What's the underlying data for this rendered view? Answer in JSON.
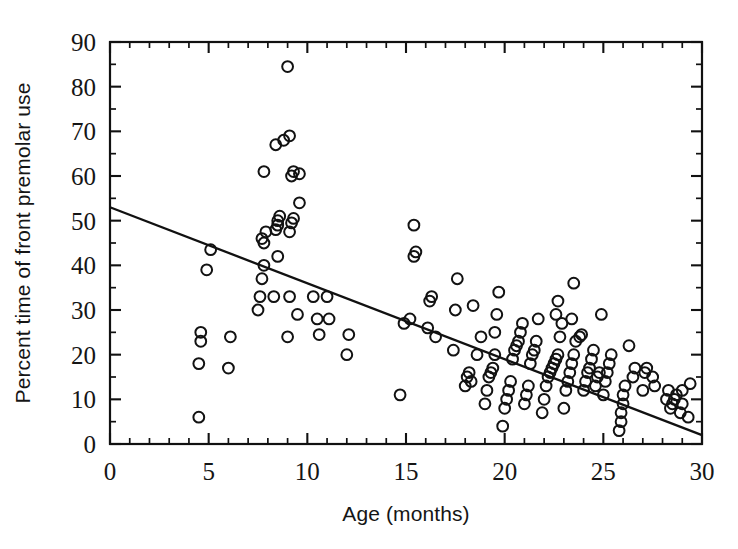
{
  "chart_data": {
    "type": "scatter",
    "title": "",
    "xlabel": "Age (months)",
    "ylabel": "Percent time of front premolar use",
    "xlim": [
      0,
      30
    ],
    "ylim": [
      0,
      90
    ],
    "xticks": [
      0,
      5,
      10,
      15,
      20,
      25,
      30
    ],
    "yticks": [
      0,
      10,
      20,
      30,
      40,
      50,
      60,
      70,
      80,
      90
    ],
    "x_minor_step": 1,
    "y_minor_step": 5,
    "grid": false,
    "legend": null,
    "marker": "open-circle",
    "marker_color": "#121212",
    "series": [
      {
        "name": "Front premolar use",
        "points": [
          [
            4.5,
            6
          ],
          [
            4.5,
            18
          ],
          [
            4.6,
            23
          ],
          [
            4.6,
            25
          ],
          [
            4.9,
            39
          ],
          [
            5.1,
            43.5
          ],
          [
            6.0,
            17
          ],
          [
            6.1,
            24
          ],
          [
            7.5,
            30
          ],
          [
            7.6,
            33
          ],
          [
            7.7,
            37
          ],
          [
            7.8,
            40
          ],
          [
            7.8,
            45
          ],
          [
            7.7,
            46
          ],
          [
            7.9,
            47.5
          ],
          [
            7.8,
            61
          ],
          [
            8.3,
            33
          ],
          [
            8.5,
            42
          ],
          [
            8.4,
            48
          ],
          [
            8.5,
            49
          ],
          [
            8.5,
            50
          ],
          [
            8.6,
            51
          ],
          [
            8.4,
            67
          ],
          [
            8.8,
            68
          ],
          [
            9.0,
            24
          ],
          [
            9.1,
            33
          ],
          [
            9.1,
            47.5
          ],
          [
            9.2,
            49.5
          ],
          [
            9.3,
            50.5
          ],
          [
            9.2,
            60
          ],
          [
            9.3,
            61
          ],
          [
            9.1,
            69
          ],
          [
            9.0,
            84.5
          ],
          [
            9.5,
            29
          ],
          [
            9.6,
            54
          ],
          [
            9.6,
            60.5
          ],
          [
            10.3,
            33
          ],
          [
            10.5,
            28
          ],
          [
            10.6,
            24.5
          ],
          [
            11.0,
            33
          ],
          [
            11.1,
            28
          ],
          [
            12.0,
            20
          ],
          [
            12.1,
            24.5
          ],
          [
            14.7,
            11
          ],
          [
            14.9,
            27
          ],
          [
            15.2,
            28
          ],
          [
            15.4,
            42
          ],
          [
            15.5,
            43
          ],
          [
            15.4,
            49
          ],
          [
            16.1,
            26
          ],
          [
            16.2,
            32
          ],
          [
            16.3,
            33
          ],
          [
            16.5,
            24
          ],
          [
            17.4,
            21
          ],
          [
            17.5,
            30
          ],
          [
            17.6,
            37
          ],
          [
            18.0,
            13
          ],
          [
            18.1,
            15
          ],
          [
            18.2,
            16
          ],
          [
            18.3,
            14
          ],
          [
            18.4,
            31
          ],
          [
            18.6,
            20
          ],
          [
            18.8,
            24
          ],
          [
            19.0,
            9
          ],
          [
            19.1,
            12
          ],
          [
            19.2,
            15
          ],
          [
            19.3,
            16
          ],
          [
            19.4,
            17
          ],
          [
            19.5,
            20
          ],
          [
            19.5,
            25
          ],
          [
            19.6,
            29
          ],
          [
            19.7,
            34
          ],
          [
            19.9,
            4
          ],
          [
            20.0,
            8
          ],
          [
            20.1,
            10
          ],
          [
            20.2,
            12
          ],
          [
            20.3,
            14
          ],
          [
            20.4,
            19
          ],
          [
            20.5,
            21
          ],
          [
            20.6,
            22
          ],
          [
            20.7,
            23
          ],
          [
            20.8,
            25
          ],
          [
            20.9,
            27
          ],
          [
            21.0,
            9
          ],
          [
            21.1,
            11
          ],
          [
            21.2,
            13
          ],
          [
            21.3,
            18
          ],
          [
            21.4,
            20
          ],
          [
            21.5,
            21
          ],
          [
            21.6,
            23
          ],
          [
            21.7,
            28
          ],
          [
            21.9,
            7
          ],
          [
            22.0,
            10
          ],
          [
            22.1,
            13
          ],
          [
            22.2,
            15
          ],
          [
            22.3,
            16
          ],
          [
            22.4,
            17
          ],
          [
            22.5,
            18
          ],
          [
            22.6,
            19
          ],
          [
            22.7,
            20
          ],
          [
            22.8,
            24
          ],
          [
            22.9,
            27
          ],
          [
            22.6,
            29
          ],
          [
            22.7,
            32
          ],
          [
            23.0,
            8
          ],
          [
            23.1,
            12
          ],
          [
            23.2,
            14
          ],
          [
            23.3,
            16
          ],
          [
            23.4,
            18
          ],
          [
            23.5,
            20
          ],
          [
            23.6,
            23
          ],
          [
            23.4,
            28
          ],
          [
            23.5,
            36
          ],
          [
            23.8,
            24
          ],
          [
            23.9,
            24.5
          ],
          [
            24.0,
            12
          ],
          [
            24.1,
            14
          ],
          [
            24.2,
            16
          ],
          [
            24.3,
            17
          ],
          [
            24.4,
            19
          ],
          [
            24.5,
            21
          ],
          [
            24.6,
            13
          ],
          [
            24.7,
            15
          ],
          [
            24.8,
            16
          ],
          [
            24.9,
            29
          ],
          [
            25.0,
            11
          ],
          [
            25.1,
            14
          ],
          [
            25.2,
            16
          ],
          [
            25.3,
            18
          ],
          [
            25.4,
            20
          ],
          [
            25.8,
            3
          ],
          [
            25.9,
            5
          ],
          [
            25.9,
            7
          ],
          [
            26.0,
            9
          ],
          [
            26.0,
            11
          ],
          [
            26.1,
            13
          ],
          [
            26.3,
            22
          ],
          [
            26.5,
            15
          ],
          [
            26.6,
            17
          ],
          [
            27.0,
            12
          ],
          [
            27.1,
            16
          ],
          [
            27.2,
            17
          ],
          [
            27.5,
            15
          ],
          [
            27.6,
            13
          ],
          [
            28.2,
            10
          ],
          [
            28.3,
            12
          ],
          [
            28.4,
            8
          ],
          [
            28.5,
            9
          ],
          [
            28.6,
            10
          ],
          [
            28.7,
            11
          ],
          [
            28.9,
            7
          ],
          [
            29.0,
            9
          ],
          [
            29.0,
            12
          ],
          [
            29.4,
            13.5
          ],
          [
            29.3,
            6
          ]
        ]
      }
    ],
    "fit_line": {
      "name": "regression-line",
      "x0": 0,
      "y0": 53,
      "x1": 30,
      "y1": 2
    }
  }
}
